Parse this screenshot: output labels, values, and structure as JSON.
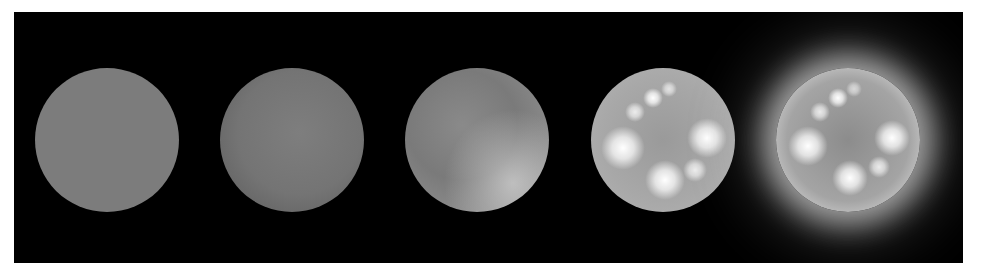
{
  "figure": {
    "background_color": "#000000",
    "frame_color": "#ffffff",
    "spheres": [
      {
        "id": 1,
        "stage": "flat",
        "base_color": "#7c7c7c",
        "highlights": 0,
        "glow": false
      },
      {
        "id": 2,
        "stage": "soft-shaded",
        "base_color": "#747474",
        "highlights": 0,
        "glow": false
      },
      {
        "id": 3,
        "stage": "directionally-lit",
        "base_color": "#8a8a8a",
        "highlights": 0,
        "glow": false
      },
      {
        "id": 4,
        "stage": "specular-spots",
        "base_color": "#a8a8a8",
        "highlights": 7,
        "glow": false
      },
      {
        "id": 5,
        "stage": "glowing-rim",
        "base_color": "#a4a4a4",
        "highlights": 7,
        "glow": true
      }
    ]
  }
}
